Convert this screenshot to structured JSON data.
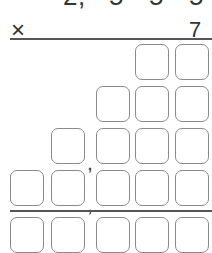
{
  "problem": {
    "multiplicand_digits_partial": [
      "2",
      ",",
      "5",
      "5",
      "5"
    ],
    "operator": "×",
    "multiplier": "7"
  },
  "colors": {
    "text": "#333333",
    "rule": "#555555",
    "box_border": "#8a8a8a"
  },
  "answer_grid": {
    "row_1_boxes": 2,
    "row_2_boxes": 3,
    "row_3_boxes": 4,
    "row_4_boxes": 5,
    "result_row_boxes": 5,
    "comma": ","
  }
}
